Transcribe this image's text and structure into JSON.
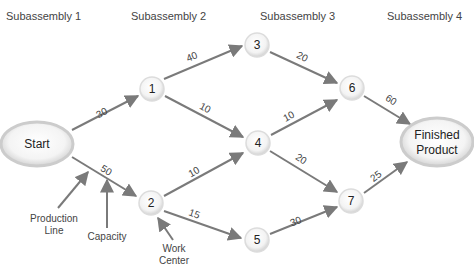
{
  "headers": [
    "Subassembly 1",
    "Subassembly 2",
    "Subassembly 3",
    "Subassembly 4"
  ],
  "nodes": {
    "start": "Start",
    "n1": "1",
    "n2": "2",
    "n3": "3",
    "n4": "4",
    "n5": "5",
    "n6": "6",
    "n7": "7",
    "finish_line1": "Finished",
    "finish_line2": "Product"
  },
  "edges": [
    {
      "from": "Start",
      "to": "1",
      "capacity": "30"
    },
    {
      "from": "Start",
      "to": "2",
      "capacity": "50"
    },
    {
      "from": "1",
      "to": "3",
      "capacity": "40"
    },
    {
      "from": "1",
      "to": "4",
      "capacity": "10"
    },
    {
      "from": "2",
      "to": "4",
      "capacity": "10"
    },
    {
      "from": "2",
      "to": "5",
      "capacity": "15"
    },
    {
      "from": "3",
      "to": "6",
      "capacity": "20"
    },
    {
      "from": "4",
      "to": "6",
      "capacity": "10"
    },
    {
      "from": "4",
      "to": "7",
      "capacity": "20"
    },
    {
      "from": "5",
      "to": "7",
      "capacity": "30"
    },
    {
      "from": "6",
      "to": "Finished Product",
      "capacity": "60"
    },
    {
      "from": "7",
      "to": "Finished Product",
      "capacity": "25"
    }
  ],
  "annotations": {
    "production_line_1": "Production",
    "production_line_2": "Line",
    "capacity": "Capacity",
    "work_center_1": "Work",
    "work_center_2": "Center"
  },
  "colors": {
    "arrow": "#7a7a7a",
    "node_fill": "#f4f4f4",
    "node_ring": "#cfcfcf",
    "text": "#333333"
  }
}
